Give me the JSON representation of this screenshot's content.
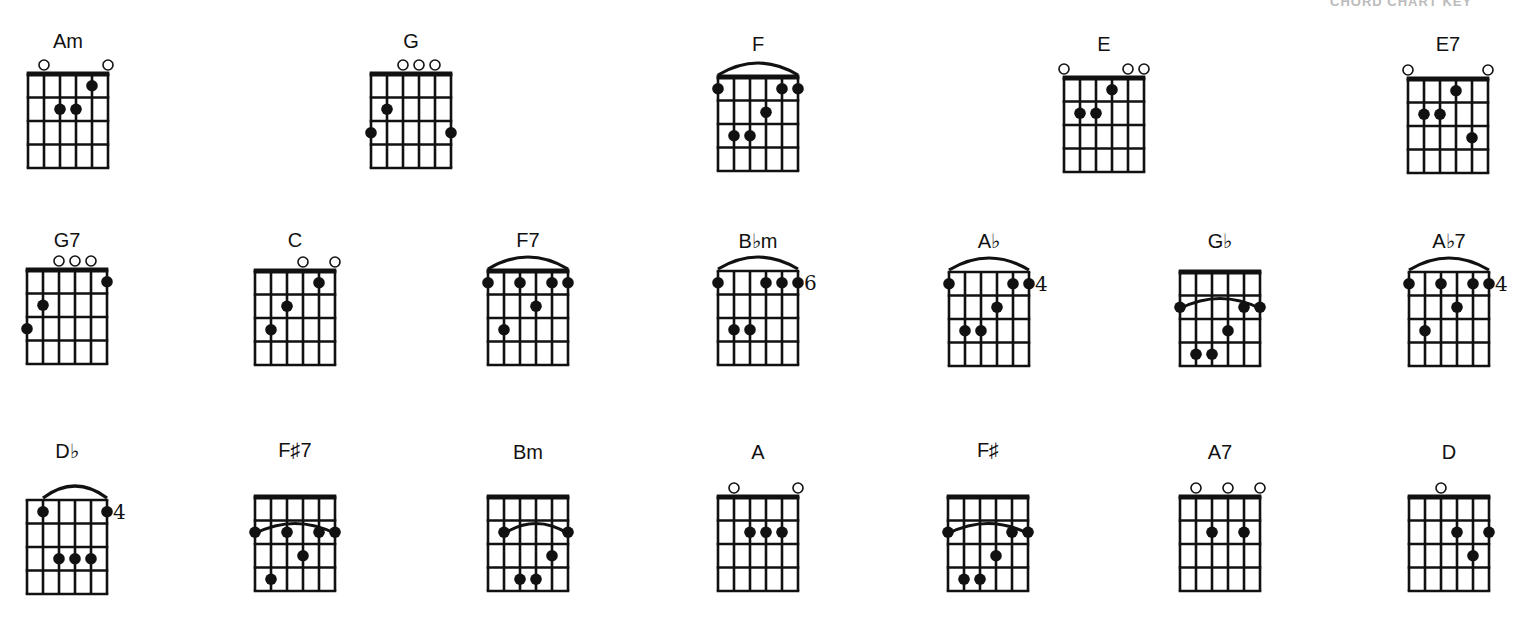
{
  "header_fragment": "CHORD CHART KEY",
  "colors": {
    "ink": "#111111",
    "background": "#ffffff"
  },
  "grid": {
    "strings": 6,
    "frets": 4,
    "string_gap": 16,
    "fret_gap": 23.5
  },
  "chords": [
    {
      "name": "Am",
      "x": 28,
      "y": 74,
      "label_y": 30,
      "nut": true,
      "open": [
        1,
        5
      ],
      "dots": [
        [
          4,
          1
        ],
        [
          2,
          2
        ],
        [
          3,
          2
        ]
      ]
    },
    {
      "name": "G",
      "x": 371,
      "y": 74,
      "label_y": 30,
      "nut": true,
      "open": [
        2,
        3,
        4
      ],
      "dots": [
        [
          1,
          2
        ],
        [
          0,
          3
        ],
        [
          5,
          3
        ]
      ]
    },
    {
      "name": "F",
      "x": 718,
      "y": 77,
      "label_y": 33,
      "nut": true,
      "barre": {
        "fret": 1,
        "from": 0,
        "to": 5,
        "above": true
      },
      "dots": [
        [
          0,
          1
        ],
        [
          4,
          1
        ],
        [
          5,
          1
        ],
        [
          3,
          2
        ],
        [
          1,
          3
        ],
        [
          2,
          3
        ]
      ]
    },
    {
      "name": "E",
      "x": 1064,
      "y": 78,
      "label_y": 33,
      "nut": true,
      "open": [
        0,
        4,
        5
      ],
      "dots": [
        [
          3,
          1
        ],
        [
          1,
          2
        ],
        [
          2,
          2
        ]
      ]
    },
    {
      "name": "E7",
      "x": 1408,
      "y": 79,
      "label_y": 33,
      "nut": true,
      "open": [
        0,
        5
      ],
      "dots": [
        [
          3,
          1
        ],
        [
          1,
          2
        ],
        [
          2,
          2
        ],
        [
          4,
          3
        ]
      ]
    },
    {
      "name": "G7",
      "x": 27,
      "y": 270,
      "label_y": 229,
      "nut": true,
      "open": [
        2,
        3,
        4
      ],
      "dots": [
        [
          5,
          1
        ],
        [
          1,
          2
        ],
        [
          0,
          3
        ]
      ]
    },
    {
      "name": "C",
      "x": 255,
      "y": 271,
      "label_y": 229,
      "nut": true,
      "open": [
        3,
        5
      ],
      "dots": [
        [
          4,
          1
        ],
        [
          2,
          2
        ],
        [
          1,
          3
        ]
      ]
    },
    {
      "name": "F7",
      "x": 488,
      "y": 271,
      "label_y": 229,
      "nut": true,
      "barre": {
        "fret": 1,
        "from": 0,
        "to": 5,
        "above": true
      },
      "dots": [
        [
          0,
          1
        ],
        [
          2,
          1
        ],
        [
          4,
          1
        ],
        [
          5,
          1
        ],
        [
          3,
          2
        ],
        [
          1,
          3
        ]
      ]
    },
    {
      "name": "B♭m",
      "x": 718,
      "y": 271,
      "label_y": 229,
      "nut": false,
      "barre": {
        "fret": 1,
        "from": 0,
        "to": 5,
        "above": true
      },
      "position": "6",
      "dots": [
        [
          0,
          1
        ],
        [
          3,
          1
        ],
        [
          4,
          1
        ],
        [
          5,
          1
        ],
        [
          1,
          3
        ],
        [
          2,
          3
        ]
      ]
    },
    {
      "name": "A♭",
      "x": 949,
      "y": 272,
      "label_y": 229,
      "nut": false,
      "barre": {
        "fret": 1,
        "from": 0,
        "to": 5,
        "above": true
      },
      "position": "4",
      "dots": [
        [
          0,
          1
        ],
        [
          4,
          1
        ],
        [
          5,
          1
        ],
        [
          3,
          2
        ],
        [
          1,
          3
        ],
        [
          2,
          3
        ]
      ]
    },
    {
      "name": "G♭",
      "x": 1180,
      "y": 272,
      "label_y": 229,
      "nut": true,
      "barre": {
        "fret": 2,
        "from": 0,
        "to": 5,
        "above": false
      },
      "dots": [
        [
          0,
          2
        ],
        [
          4,
          2
        ],
        [
          5,
          2
        ],
        [
          3,
          3
        ],
        [
          1,
          4
        ],
        [
          2,
          4
        ]
      ]
    },
    {
      "name": "A♭7",
      "x": 1409,
      "y": 272,
      "label_y": 229,
      "nut": false,
      "barre": {
        "fret": 1,
        "from": 0,
        "to": 5,
        "above": true
      },
      "position": "4",
      "dots": [
        [
          0,
          1
        ],
        [
          2,
          1
        ],
        [
          4,
          1
        ],
        [
          5,
          1
        ],
        [
          3,
          2
        ],
        [
          1,
          3
        ]
      ]
    },
    {
      "name": "D♭",
      "x": 27,
      "y": 500,
      "label_y": 439,
      "nut": false,
      "barre": {
        "fret": 1,
        "from": 1,
        "to": 5,
        "above": true
      },
      "position": "4",
      "dots": [
        [
          1,
          1
        ],
        [
          5,
          1
        ],
        [
          2,
          3
        ],
        [
          3,
          3
        ],
        [
          4,
          3
        ]
      ]
    },
    {
      "name": "F♯7",
      "x": 255,
      "y": 497,
      "label_y": 439,
      "nut": true,
      "barre": {
        "fret": 2,
        "from": 0,
        "to": 5,
        "above": false
      },
      "dots": [
        [
          0,
          2
        ],
        [
          2,
          2
        ],
        [
          4,
          2
        ],
        [
          5,
          2
        ],
        [
          3,
          3
        ],
        [
          1,
          4
        ]
      ]
    },
    {
      "name": "Bm",
      "x": 488,
      "y": 497,
      "label_y": 441,
      "nut": true,
      "barre": {
        "fret": 2,
        "from": 1,
        "to": 5,
        "above": false
      },
      "dots": [
        [
          1,
          2
        ],
        [
          5,
          2
        ],
        [
          4,
          3
        ],
        [
          2,
          4
        ],
        [
          3,
          4
        ]
      ]
    },
    {
      "name": "A",
      "x": 718,
      "y": 497,
      "label_y": 441,
      "nut": true,
      "open": [
        1,
        5
      ],
      "dots": [
        [
          2,
          2
        ],
        [
          3,
          2
        ],
        [
          4,
          2
        ]
      ]
    },
    {
      "name": "F♯",
      "x": 948,
      "y": 497,
      "label_y": 439,
      "nut": true,
      "barre": {
        "fret": 2,
        "from": 0,
        "to": 5,
        "above": false
      },
      "dots": [
        [
          0,
          2
        ],
        [
          4,
          2
        ],
        [
          5,
          2
        ],
        [
          3,
          3
        ],
        [
          1,
          4
        ],
        [
          2,
          4
        ]
      ]
    },
    {
      "name": "A7",
      "x": 1180,
      "y": 497,
      "label_y": 441,
      "nut": true,
      "open": [
        1,
        3,
        5
      ],
      "dots": [
        [
          2,
          2
        ],
        [
          4,
          2
        ]
      ]
    },
    {
      "name": "D",
      "x": 1409,
      "y": 497,
      "label_y": 441,
      "nut": true,
      "open": [
        2
      ],
      "dots": [
        [
          3,
          2
        ],
        [
          5,
          2
        ],
        [
          4,
          3
        ]
      ]
    }
  ]
}
